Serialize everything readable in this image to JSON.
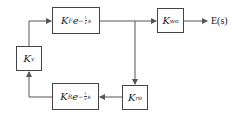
{
  "diagram": {
    "type": "block-diagram",
    "blocks": {
      "kv": {
        "symbol": "K",
        "sub": "v"
      },
      "forward": {
        "symbol": "K",
        "sub": "F",
        "exp_base": "e",
        "exp_sign": "−",
        "exp_num": "l",
        "exp_den": "v",
        "exp_var": "s"
      },
      "kwo": {
        "symbol": "K",
        "sub": "wo"
      },
      "kro": {
        "symbol": "K",
        "sub": "ro"
      },
      "feedback": {
        "symbol": "K",
        "sub": "R",
        "exp_base": "e",
        "exp_sign": "−",
        "exp_num": "l",
        "exp_den": "v",
        "exp_var": "s"
      }
    },
    "output_label": "E(s)",
    "colors": {
      "line": "#555555",
      "box_border": "#444444",
      "text": "#222222"
    }
  }
}
